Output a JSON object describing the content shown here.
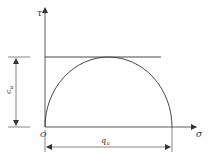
{
  "diagram": {
    "axes": {
      "y_label": "τ",
      "x_label": "σ",
      "origin_label": "O"
    },
    "dimensions": {
      "vertical_label": "c",
      "vertical_subscript": "u",
      "horizontal_label": "q",
      "horizontal_subscript": "u"
    },
    "elements": [
      "tangent-line",
      "semicircle",
      "vertical-dimension",
      "horizontal-dimension"
    ],
    "colors": {
      "stroke": "#333333",
      "background": "#ffffff"
    }
  }
}
